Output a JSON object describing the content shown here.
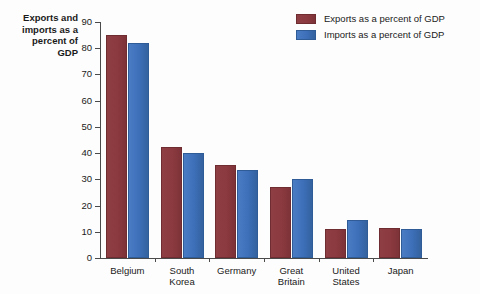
{
  "chart_data": {
    "type": "bar",
    "xlabel": "",
    "ylabel": "Exports and imports as a percent of GDP",
    "ylim": [
      0,
      90
    ],
    "yticks": [
      0,
      10,
      20,
      30,
      40,
      50,
      60,
      70,
      80,
      90
    ],
    "grid": false,
    "legend_position": "top-right",
    "categories": [
      "Belgium",
      "South Korea",
      "Germany",
      "Great Britain",
      "United States",
      "Japan"
    ],
    "series": [
      {
        "name": "Exports as a percent of GDP",
        "color": "#8b3a3f",
        "values": [
          85,
          42.5,
          35.5,
          27,
          11,
          11.5
        ]
      },
      {
        "name": "Imports as a percent of GDP",
        "color": "#3c6fb8",
        "values": [
          82,
          40,
          33.5,
          30,
          14.5,
          11
        ]
      }
    ]
  },
  "axis_title_lines": [
    "Exports and",
    "imports as a",
    "percent of",
    "GDP"
  ],
  "category_lines": [
    [
      "Belgium"
    ],
    [
      "South",
      "Korea"
    ],
    [
      "Germany"
    ],
    [
      "Great",
      "Britain"
    ],
    [
      "United",
      "States"
    ],
    [
      "Japan"
    ]
  ]
}
